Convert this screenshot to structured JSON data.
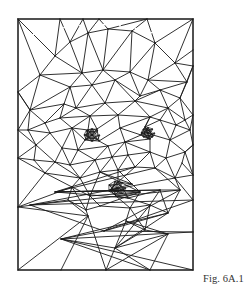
{
  "figure": {
    "caption": "Fig. 6A.1",
    "frame": {
      "x": 18,
      "y": 19,
      "width": 175,
      "height": 251
    },
    "stroke_color": "#1a1a1a",
    "background": "#ffffff"
  },
  "mesh": {
    "vertices": [
      [
        18,
        19
      ],
      [
        60,
        19
      ],
      [
        83,
        19
      ],
      [
        99,
        19
      ],
      [
        147,
        19
      ],
      [
        193,
        19
      ],
      [
        18,
        92
      ],
      [
        18,
        130
      ],
      [
        18,
        158
      ],
      [
        18,
        207
      ],
      [
        18,
        270
      ],
      [
        193,
        50
      ],
      [
        193,
        66
      ],
      [
        193,
        115
      ],
      [
        193,
        145
      ],
      [
        193,
        175
      ],
      [
        193,
        200
      ],
      [
        193,
        232
      ],
      [
        193,
        270
      ],
      [
        61,
        270
      ],
      [
        106,
        270
      ],
      [
        150,
        270
      ],
      [
        55,
        56
      ],
      [
        70,
        42
      ],
      [
        88,
        33
      ],
      [
        108,
        29
      ],
      [
        132,
        31
      ],
      [
        155,
        43
      ],
      [
        40,
        75
      ],
      [
        82,
        73
      ],
      [
        103,
        70
      ],
      [
        130,
        72
      ],
      [
        148,
        80
      ],
      [
        175,
        63
      ],
      [
        187,
        82
      ],
      [
        70,
        87
      ],
      [
        92,
        85
      ],
      [
        115,
        80
      ],
      [
        140,
        96
      ],
      [
        160,
        90
      ],
      [
        180,
        98
      ],
      [
        30,
        110
      ],
      [
        64,
        104
      ],
      [
        76,
        108
      ],
      [
        105,
        103
      ],
      [
        135,
        101
      ],
      [
        168,
        108
      ],
      [
        185,
        120
      ],
      [
        45,
        123
      ],
      [
        60,
        118
      ],
      [
        90,
        116
      ],
      [
        118,
        115
      ],
      [
        150,
        117
      ],
      [
        176,
        125
      ],
      [
        28,
        130
      ],
      [
        50,
        133
      ],
      [
        72,
        128
      ],
      [
        120,
        128
      ],
      [
        160,
        120
      ],
      [
        190,
        130
      ],
      [
        92,
        135
      ],
      [
        85,
        140
      ],
      [
        99,
        141
      ],
      [
        88,
        130
      ],
      [
        97,
        129
      ],
      [
        147,
        132
      ],
      [
        141,
        135
      ],
      [
        153,
        135
      ],
      [
        145,
        127
      ],
      [
        150,
        139
      ],
      [
        36,
        145
      ],
      [
        62,
        148
      ],
      [
        78,
        150
      ],
      [
        108,
        146
      ],
      [
        125,
        142
      ],
      [
        170,
        140
      ],
      [
        185,
        152
      ],
      [
        34,
        160
      ],
      [
        55,
        162
      ],
      [
        70,
        165
      ],
      [
        95,
        160
      ],
      [
        112,
        157
      ],
      [
        128,
        155
      ],
      [
        150,
        152
      ],
      [
        166,
        158
      ],
      [
        182,
        163
      ],
      [
        45,
        173
      ],
      [
        80,
        178
      ],
      [
        100,
        172
      ],
      [
        118,
        170
      ],
      [
        135,
        167
      ],
      [
        155,
        168
      ],
      [
        175,
        178
      ],
      [
        118,
        182
      ],
      [
        110,
        190
      ],
      [
        124,
        190
      ],
      [
        116,
        196
      ],
      [
        128,
        198
      ],
      [
        104,
        184
      ],
      [
        132,
        184
      ],
      [
        55,
        192
      ],
      [
        72,
        187
      ],
      [
        90,
        196
      ],
      [
        140,
        192
      ],
      [
        160,
        190
      ],
      [
        180,
        190
      ],
      [
        30,
        205
      ],
      [
        68,
        200
      ],
      [
        86,
        210
      ],
      [
        100,
        206
      ],
      [
        130,
        208
      ],
      [
        150,
        205
      ],
      [
        168,
        213
      ],
      [
        104,
        231
      ],
      [
        126,
        221
      ],
      [
        145,
        230
      ],
      [
        115,
        248
      ],
      [
        168,
        234
      ],
      [
        61,
        239
      ],
      [
        88,
        216
      ]
    ],
    "edges": [
      [
        0,
        1
      ],
      [
        1,
        2
      ],
      [
        2,
        3
      ],
      [
        3,
        4
      ],
      [
        4,
        5
      ],
      [
        5,
        11
      ],
      [
        11,
        12
      ],
      [
        12,
        13
      ],
      [
        13,
        14
      ],
      [
        14,
        15
      ],
      [
        15,
        16
      ],
      [
        16,
        17
      ],
      [
        17,
        18
      ],
      [
        18,
        21
      ],
      [
        21,
        20
      ],
      [
        20,
        19
      ],
      [
        19,
        10
      ],
      [
        10,
        9
      ],
      [
        9,
        8
      ],
      [
        8,
        7
      ],
      [
        7,
        6
      ],
      [
        6,
        0
      ],
      [
        0,
        22
      ],
      [
        0,
        28
      ],
      [
        1,
        22
      ],
      [
        1,
        23
      ],
      [
        2,
        23
      ],
      [
        2,
        24
      ],
      [
        3,
        24
      ],
      [
        3,
        25
      ],
      [
        4,
        25
      ],
      [
        4,
        26
      ],
      [
        4,
        27
      ],
      [
        5,
        27
      ],
      [
        5,
        33
      ],
      [
        22,
        23
      ],
      [
        23,
        24
      ],
      [
        24,
        25
      ],
      [
        25,
        26
      ],
      [
        26,
        27
      ],
      [
        27,
        33
      ],
      [
        33,
        11
      ],
      [
        33,
        12
      ],
      [
        33,
        34
      ],
      [
        12,
        34
      ],
      [
        6,
        28
      ],
      [
        22,
        28
      ],
      [
        22,
        29
      ],
      [
        23,
        29
      ],
      [
        24,
        29
      ],
      [
        24,
        30
      ],
      [
        25,
        30
      ],
      [
        26,
        30
      ],
      [
        26,
        31
      ],
      [
        27,
        31
      ],
      [
        27,
        32
      ],
      [
        32,
        33
      ],
      [
        32,
        34
      ],
      [
        28,
        29
      ],
      [
        29,
        30
      ],
      [
        30,
        31
      ],
      [
        31,
        32
      ],
      [
        6,
        41
      ],
      [
        28,
        41
      ],
      [
        28,
        35
      ],
      [
        29,
        35
      ],
      [
        29,
        36
      ],
      [
        30,
        36
      ],
      [
        30,
        37
      ],
      [
        31,
        37
      ],
      [
        31,
        38
      ],
      [
        32,
        38
      ],
      [
        32,
        39
      ],
      [
        34,
        39
      ],
      [
        34,
        40
      ],
      [
        12,
        40
      ],
      [
        13,
        40
      ],
      [
        35,
        36
      ],
      [
        36,
        37
      ],
      [
        37,
        38
      ],
      [
        38,
        39
      ],
      [
        39,
        40
      ],
      [
        41,
        35
      ],
      [
        35,
        42
      ],
      [
        35,
        43
      ],
      [
        36,
        43
      ],
      [
        36,
        44
      ],
      [
        37,
        44
      ],
      [
        37,
        45
      ],
      [
        38,
        45
      ],
      [
        39,
        45
      ],
      [
        39,
        46
      ],
      [
        40,
        46
      ],
      [
        40,
        47
      ],
      [
        13,
        47
      ],
      [
        41,
        42
      ],
      [
        42,
        43
      ],
      [
        43,
        44
      ],
      [
        44,
        45
      ],
      [
        45,
        46
      ],
      [
        46,
        47
      ],
      [
        6,
        41
      ],
      [
        7,
        41
      ],
      [
        7,
        54
      ],
      [
        41,
        48
      ],
      [
        41,
        54
      ],
      [
        42,
        48
      ],
      [
        42,
        49
      ],
      [
        43,
        49
      ],
      [
        43,
        50
      ],
      [
        44,
        50
      ],
      [
        44,
        51
      ],
      [
        45,
        51
      ],
      [
        45,
        52
      ],
      [
        46,
        52
      ],
      [
        46,
        58
      ],
      [
        46,
        53
      ],
      [
        47,
        53
      ],
      [
        47,
        59
      ],
      [
        13,
        59
      ],
      [
        48,
        49
      ],
      [
        49,
        50
      ],
      [
        50,
        51
      ],
      [
        51,
        52
      ],
      [
        52,
        58
      ],
      [
        58,
        53
      ],
      [
        53,
        59
      ],
      [
        54,
        48
      ],
      [
        54,
        55
      ],
      [
        48,
        55
      ],
      [
        49,
        56
      ],
      [
        55,
        56
      ],
      [
        50,
        56
      ],
      [
        56,
        63
      ],
      [
        50,
        63
      ],
      [
        50,
        64
      ],
      [
        51,
        64
      ],
      [
        51,
        57
      ],
      [
        57,
        74
      ],
      [
        52,
        57
      ],
      [
        52,
        68
      ],
      [
        58,
        68
      ],
      [
        58,
        75
      ],
      [
        53,
        75
      ],
      [
        59,
        75
      ],
      [
        59,
        14
      ],
      [
        14,
        76
      ],
      [
        75,
        76
      ],
      [
        60,
        61
      ],
      [
        60,
        62
      ],
      [
        60,
        63
      ],
      [
        60,
        64
      ],
      [
        61,
        63
      ],
      [
        63,
        64
      ],
      [
        64,
        62
      ],
      [
        61,
        62
      ],
      [
        56,
        61
      ],
      [
        61,
        72
      ],
      [
        62,
        73
      ],
      [
        62,
        57
      ],
      [
        65,
        66
      ],
      [
        65,
        67
      ],
      [
        65,
        68
      ],
      [
        65,
        69
      ],
      [
        66,
        68
      ],
      [
        68,
        67
      ],
      [
        67,
        69
      ],
      [
        66,
        69
      ],
      [
        57,
        66
      ],
      [
        74,
        66
      ],
      [
        69,
        83
      ],
      [
        67,
        75
      ],
      [
        52,
        68
      ],
      [
        7,
        70
      ],
      [
        8,
        70
      ],
      [
        54,
        70
      ],
      [
        55,
        70
      ],
      [
        55,
        71
      ],
      [
        56,
        71
      ],
      [
        56,
        72
      ],
      [
        71,
        72
      ],
      [
        72,
        73
      ],
      [
        73,
        74
      ],
      [
        74,
        69
      ],
      [
        74,
        83
      ],
      [
        83,
        84
      ],
      [
        84,
        75
      ],
      [
        84,
        76
      ],
      [
        76,
        85
      ],
      [
        15,
        85
      ],
      [
        14,
        76
      ],
      [
        15,
        76
      ],
      [
        8,
        77
      ],
      [
        70,
        77
      ],
      [
        70,
        78
      ],
      [
        71,
        78
      ],
      [
        71,
        79
      ],
      [
        72,
        79
      ],
      [
        72,
        80
      ],
      [
        73,
        80
      ],
      [
        73,
        81
      ],
      [
        74,
        81
      ],
      [
        74,
        82
      ],
      [
        82,
        83
      ],
      [
        77,
        78
      ],
      [
        78,
        79
      ],
      [
        79,
        80
      ],
      [
        80,
        81
      ],
      [
        81,
        82
      ],
      [
        8,
        86
      ],
      [
        77,
        86
      ],
      [
        78,
        86
      ],
      [
        78,
        87
      ],
      [
        79,
        87
      ],
      [
        80,
        87
      ],
      [
        80,
        88
      ],
      [
        81,
        88
      ],
      [
        81,
        89
      ],
      [
        82,
        89
      ],
      [
        82,
        90
      ],
      [
        83,
        90
      ],
      [
        83,
        91
      ],
      [
        84,
        91
      ],
      [
        84,
        92
      ],
      [
        85,
        92
      ],
      [
        15,
        92
      ],
      [
        16,
        92
      ],
      [
        86,
        87
      ],
      [
        87,
        88
      ],
      [
        88,
        89
      ],
      [
        89,
        90
      ],
      [
        90,
        91
      ],
      [
        91,
        92
      ],
      [
        88,
        99
      ],
      [
        89,
        93
      ],
      [
        89,
        99
      ],
      [
        93,
        99
      ],
      [
        93,
        94
      ],
      [
        93,
        95
      ],
      [
        94,
        95
      ],
      [
        94,
        96
      ],
      [
        95,
        97
      ],
      [
        96,
        97
      ],
      [
        99,
        94
      ],
      [
        99,
        103
      ],
      [
        94,
        103
      ],
      [
        90,
        100
      ],
      [
        90,
        93
      ],
      [
        95,
        100
      ],
      [
        91,
        100
      ],
      [
        97,
        100
      ],
      [
        100,
        104
      ],
      [
        96,
        103
      ],
      [
        86,
        101
      ],
      [
        87,
        101
      ],
      [
        87,
        102
      ],
      [
        88,
        102
      ],
      [
        88,
        103
      ],
      [
        102,
        103
      ],
      [
        101,
        102
      ],
      [
        9,
        101
      ],
      [
        9,
        86
      ],
      [
        9,
        107
      ],
      [
        101,
        107
      ],
      [
        91,
        105
      ],
      [
        92,
        105
      ],
      [
        92,
        106
      ],
      [
        16,
        106
      ],
      [
        104,
        105
      ],
      [
        105,
        106
      ],
      [
        100,
        104
      ],
      [
        97,
        104
      ],
      [
        101,
        108
      ],
      [
        102,
        108
      ],
      [
        102,
        109
      ],
      [
        103,
        109
      ],
      [
        103,
        110
      ],
      [
        96,
        110
      ],
      [
        97,
        111
      ],
      [
        104,
        111
      ],
      [
        104,
        112
      ],
      [
        105,
        112
      ],
      [
        105,
        113
      ],
      [
        106,
        113
      ],
      [
        16,
        113
      ],
      [
        17,
        113
      ],
      [
        107,
        108
      ],
      [
        108,
        109
      ],
      [
        109,
        110
      ],
      [
        110,
        111
      ],
      [
        111,
        112
      ],
      [
        112,
        113
      ],
      [
        107,
        119
      ],
      [
        108,
        119
      ],
      [
        108,
        121
      ],
      [
        109,
        121
      ],
      [
        110,
        121
      ],
      [
        110,
        114
      ],
      [
        111,
        115
      ],
      [
        114,
        115
      ],
      [
        115,
        116
      ],
      [
        112,
        116
      ],
      [
        113,
        118
      ],
      [
        112,
        118
      ],
      [
        116,
        118
      ],
      [
        17,
        118
      ],
      [
        18,
        118
      ],
      [
        9,
        119
      ],
      [
        10,
        119
      ],
      [
        19,
        119
      ],
      [
        121,
        119
      ],
      [
        121,
        114
      ],
      [
        114,
        117
      ],
      [
        117,
        20
      ],
      [
        114,
        20
      ],
      [
        119,
        20
      ],
      [
        115,
        117
      ],
      [
        116,
        117
      ],
      [
        117,
        21
      ],
      [
        116,
        21
      ],
      [
        118,
        21
      ],
      [
        110,
        115
      ],
      [
        111,
        116
      ],
      [
        121,
        20
      ]
    ]
  }
}
